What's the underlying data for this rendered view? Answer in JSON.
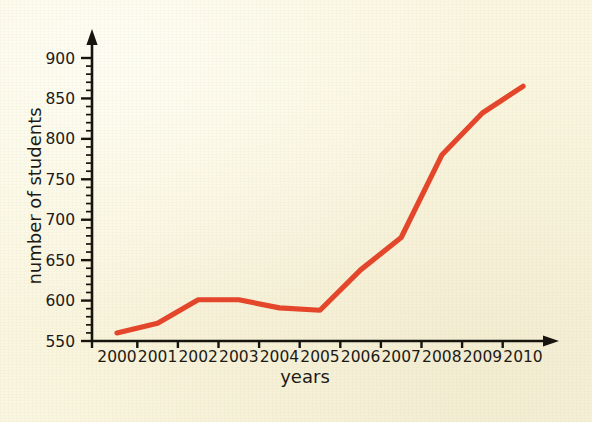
{
  "chart_data": {
    "type": "line",
    "title": "",
    "subtitle": "",
    "xlabel": "years",
    "ylabel": "number of students",
    "categories": [
      "2000",
      "2001",
      "2002",
      "2003",
      "2004",
      "2005",
      "2006",
      "2007",
      "2008",
      "2009",
      "2010"
    ],
    "x": [
      2000,
      2001,
      2002,
      2003,
      2004,
      2005,
      2006,
      2007,
      2008,
      2009,
      2010
    ],
    "values": [
      560,
      572,
      601,
      601,
      591,
      588,
      638,
      678,
      780,
      832,
      865
    ],
    "series": [
      {
        "name": "number of students",
        "color": "#e4462b",
        "values": [
          560,
          572,
          601,
          601,
          591,
          588,
          638,
          678,
          780,
          832,
          865
        ]
      }
    ],
    "xlim": [
      2000,
      2010
    ],
    "ylim": [
      550,
      900
    ],
    "y_ticks_major": [
      550,
      600,
      650,
      700,
      750,
      800,
      850,
      900
    ],
    "y_tick_labels": [
      "550",
      "600",
      "650",
      "700",
      "750",
      "800",
      "850",
      "900"
    ],
    "y_minor_step": 10,
    "x_tick_labels": [
      "2000",
      "2001",
      "2002",
      "2003",
      "2004",
      "2005",
      "2006",
      "2007",
      "2008",
      "2009",
      "2010"
    ],
    "grid": false,
    "legend": null,
    "legend_position": "none",
    "annotations": [],
    "axis_style": {
      "arrow_heads": true,
      "x_axis_color": "#17140f",
      "y_axis_color": "#17140f"
    }
  },
  "colors": {
    "background": "#faf6e0",
    "ink": "#17140f",
    "line": "#e4462b"
  }
}
